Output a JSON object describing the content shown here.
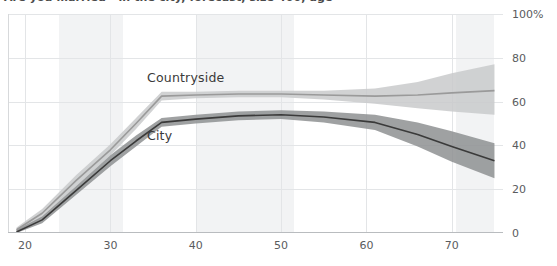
{
  "chart_data": {
    "type": "line",
    "title": "Are you married - in the city, forecast, size 400, age",
    "xlabel": "age",
    "ylabel": "",
    "xlim": [
      18,
      76
    ],
    "ylim": [
      0,
      100
    ],
    "grid": true,
    "legend_position": "inline-labels",
    "y_ticks": [
      0,
      20,
      40,
      60,
      80,
      100
    ],
    "y_tick_labels": [
      "0",
      "20",
      "40",
      "60",
      "80",
      "100%"
    ],
    "x_ticks": [
      20,
      30,
      40,
      50,
      60,
      70
    ],
    "x_tick_labels": [
      "20",
      "30",
      "40",
      "50",
      "60",
      "70"
    ],
    "series": [
      {
        "name": "Countryside",
        "color": "#9a9a9a",
        "band_color": "#c9cacb",
        "x": [
          19,
          22,
          26,
          30,
          33,
          36,
          40,
          45,
          50,
          55,
          61,
          66,
          70,
          75
        ],
        "values": [
          1.5,
          9.0,
          24.0,
          38.0,
          50.0,
          62.5,
          63.0,
          63.5,
          63.5,
          63.0,
          62.5,
          63.0,
          64.0,
          65.0
        ],
        "band_low": [
          0.5,
          7.0,
          21.5,
          35.5,
          47.5,
          60.5,
          61.5,
          62.0,
          62.0,
          61.0,
          59.0,
          57.0,
          55.5,
          54.0
        ],
        "band_high": [
          2.5,
          11.0,
          26.5,
          40.5,
          52.5,
          64.5,
          64.5,
          65.0,
          65.0,
          65.0,
          66.0,
          69.0,
          73.0,
          77.0
        ]
      },
      {
        "name": "City",
        "color": "#3a3a3a",
        "band_color": "#8e9092",
        "x": [
          19,
          22,
          26,
          30,
          33,
          36,
          40,
          45,
          50,
          55,
          61,
          66,
          70,
          75
        ],
        "values": [
          0.5,
          6.0,
          19.5,
          33.0,
          42.0,
          50.5,
          52.0,
          53.5,
          54.0,
          53.0,
          50.5,
          45.0,
          39.5,
          33.0
        ],
        "band_low": [
          0.0,
          4.5,
          17.5,
          30.5,
          39.5,
          48.5,
          50.0,
          51.5,
          52.0,
          50.5,
          47.0,
          39.5,
          32.5,
          25.0
        ],
        "band_high": [
          1.5,
          7.5,
          21.5,
          35.5,
          44.5,
          52.5,
          54.0,
          55.5,
          56.0,
          55.5,
          54.0,
          50.5,
          46.5,
          41.0
        ]
      }
    ],
    "highlight_bands": [
      {
        "x_start": 24.0,
        "x_end": 31.5
      },
      {
        "x_start": 40.0,
        "x_end": 51.5
      },
      {
        "x_start": 70.5,
        "x_end": 75.0
      }
    ],
    "inline_labels": [
      {
        "text": "Countryside",
        "x_px": 147,
        "y_px": 70
      },
      {
        "text": "City",
        "x_px": 147,
        "y_px": 128
      }
    ]
  }
}
